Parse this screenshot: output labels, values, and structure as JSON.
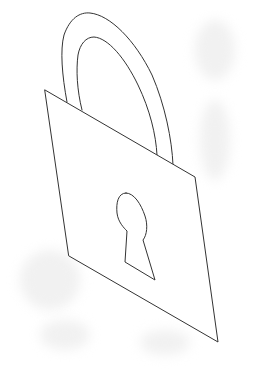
{
  "image": {
    "subject": "padlock line drawing",
    "background_color": "#ffffff",
    "stroke_color": "#333333",
    "icon": "padlock-icon"
  }
}
